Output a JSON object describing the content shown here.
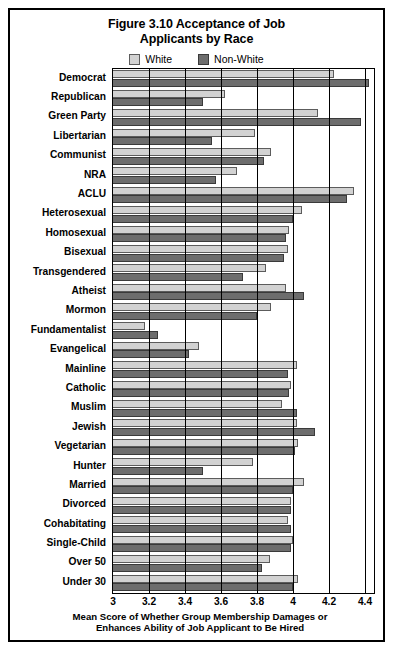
{
  "figure": {
    "title_line1": "Figure 3.10 Acceptance of Job",
    "title_line2": "Applicants by Race"
  },
  "legend": {
    "position": "top-center",
    "entries": [
      {
        "name": "white-series",
        "label": "White",
        "color": "#d2d2d2",
        "border": "#5c5c5c"
      },
      {
        "name": "nonwhite-series",
        "label": "Non-White",
        "color": "#6d6d6d",
        "border": "#3a3a3a"
      }
    ]
  },
  "axis": {
    "x_title_line1": "Mean Score of Whether Group Membership Damages or",
    "x_title_line2": "Enhances Ability of Job Applicant to Be Hired",
    "x_ticks": [
      "3",
      "3.2",
      "3.4",
      "3.6",
      "3.8",
      "4",
      "4.2",
      "4.4"
    ],
    "x_tick_values": [
      3,
      3.2,
      3.4,
      3.6,
      3.8,
      4,
      4.2,
      4.4
    ]
  },
  "chart_data": {
    "type": "bar",
    "orientation": "horizontal",
    "title": "Figure 3.10 Acceptance of Job Applicants by Race",
    "xlabel": "Mean Score of Whether Group Membership Damages or Enhances Ability of Job Applicant to Be Hired",
    "ylabel": "",
    "xlim": [
      3,
      4.45
    ],
    "grid": true,
    "legend_position": "top-center",
    "categories": [
      "Democrat",
      "Republican",
      "Green Party",
      "Libertarian",
      "Communist",
      "NRA",
      "ACLU",
      "Heterosexual",
      "Homosexual",
      "Bisexual",
      "Transgendered",
      "Atheist",
      "Mormon",
      "Fundamentalist",
      "Evangelical",
      "Mainline",
      "Catholic",
      "Muslim",
      "Jewish",
      "Vegetarian",
      "Hunter",
      "Married",
      "Divorced",
      "Cohabitating",
      "Single-Child",
      "Over 50",
      "Under 30"
    ],
    "series": [
      {
        "name": "White",
        "color": "#d2d2d2",
        "values": [
          4.23,
          3.62,
          4.14,
          3.79,
          3.88,
          3.69,
          4.34,
          4.05,
          3.98,
          3.97,
          3.85,
          3.96,
          3.88,
          3.18,
          3.48,
          4.02,
          3.99,
          3.94,
          4.02,
          4.03,
          3.78,
          4.06,
          3.99,
          3.97,
          4.0,
          3.87,
          4.03
        ]
      },
      {
        "name": "Non-White",
        "color": "#6d6d6d",
        "values": [
          4.42,
          3.5,
          4.38,
          3.55,
          3.84,
          3.57,
          4.3,
          4.0,
          3.96,
          3.95,
          3.72,
          4.06,
          3.8,
          3.25,
          3.42,
          3.97,
          3.98,
          4.02,
          4.12,
          4.01,
          3.5,
          4.0,
          3.99,
          3.99,
          3.99,
          3.83,
          4.0
        ]
      }
    ]
  }
}
